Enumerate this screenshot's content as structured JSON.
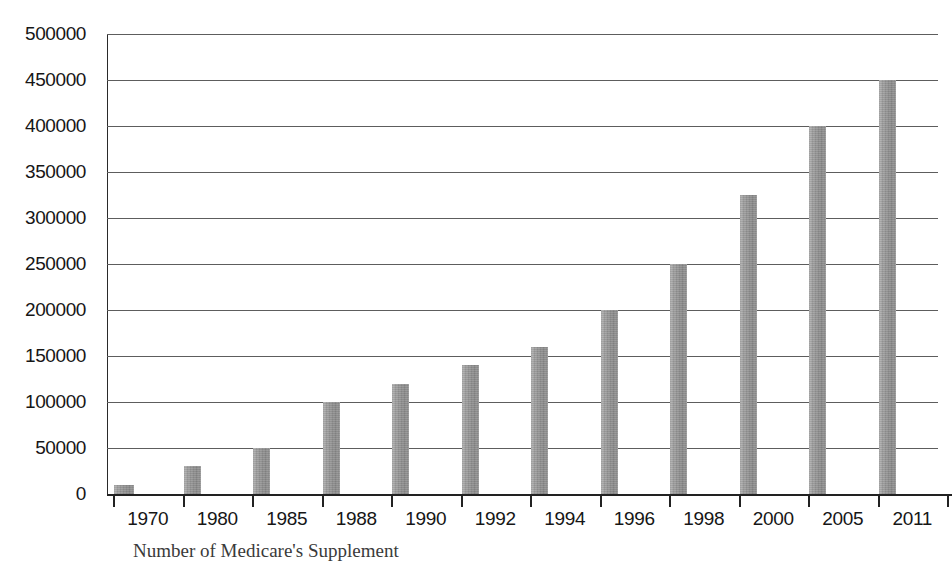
{
  "chart_data": {
    "type": "bar",
    "title": "",
    "subtitle": "",
    "xlabel": "",
    "ylabel": "",
    "categories": [
      "1970",
      "1980",
      "1985",
      "1988",
      "1990",
      "1992",
      "1994",
      "1996",
      "1998",
      "2000",
      "2005",
      "2011"
    ],
    "values": [
      10000,
      30000,
      50000,
      100000,
      120000,
      140000,
      160000,
      200000,
      250000,
      325000,
      400000,
      450000
    ],
    "series": [
      {
        "name": "",
        "values": [
          10000,
          30000,
          50000,
          100000,
          120000,
          140000,
          160000,
          200000,
          250000,
          325000,
          400000,
          450000
        ]
      }
    ],
    "ylim": [
      0,
      500000
    ],
    "yticks": [
      0,
      50000,
      100000,
      150000,
      200000,
      250000,
      300000,
      350000,
      400000,
      450000,
      500000
    ],
    "ytick_labels": [
      "0",
      "50000",
      "100000",
      "150000",
      "200000",
      "250000",
      "300000",
      "350000",
      "400000",
      "450000",
      "500000"
    ],
    "grid": true,
    "grid_axis": "y",
    "legend": false,
    "legend_position": "none",
    "bar_color": "#9a9a9a",
    "axis_color": "#222222",
    "gridline_color": "#5d5d5d",
    "background_color": "#ffffff"
  },
  "caption": {
    "text": "Number of Medicare's Supplement"
  }
}
